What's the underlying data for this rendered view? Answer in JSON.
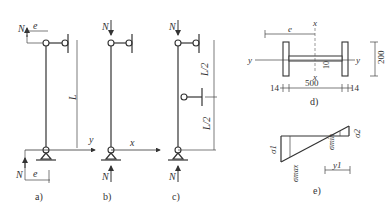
{
  "panels": {
    "a": {
      "caption": "a)",
      "force": "N",
      "eccentricity": "e",
      "length": "L",
      "axis": "y"
    },
    "b": {
      "caption": "b)",
      "force": "N",
      "axis": "x"
    },
    "c": {
      "caption": "c)",
      "force": "N",
      "upper_segment": "L/2",
      "lower_segment": "L/2"
    },
    "d": {
      "caption": "d)",
      "eccentricity": "e",
      "axis_x": "x",
      "axis_y": "y",
      "web_thickness": "10",
      "height": "200",
      "flange_thickness_left": "14",
      "width": "500",
      "flange_thickness_right": "14"
    },
    "e": {
      "caption": "e)",
      "sigma1": "σ1",
      "sigma2": "σ2",
      "sigma_max": "σmax",
      "sigma_min": "σmin",
      "y1": "y1"
    }
  }
}
